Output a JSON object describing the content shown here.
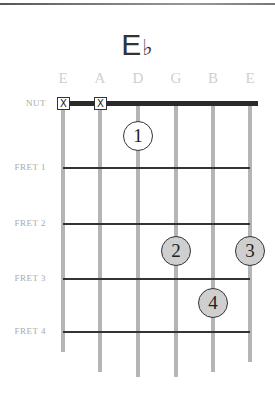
{
  "chord": {
    "root": "E",
    "accidental": "♭",
    "name": "E♭"
  },
  "strings": [
    {
      "label": "E",
      "x": 63,
      "bottom": 352
    },
    {
      "label": "A",
      "x": 100,
      "bottom": 372
    },
    {
      "label": "D",
      "x": 138,
      "bottom": 377
    },
    {
      "label": "G",
      "x": 176,
      "bottom": 377
    },
    {
      "label": "B",
      "x": 213,
      "bottom": 372
    },
    {
      "label": "E",
      "x": 250,
      "bottom": 362
    }
  ],
  "nut_label": "NUT",
  "frets": [
    {
      "label": "FRET 1",
      "y": 168
    },
    {
      "label": "FRET 2",
      "y": 224
    },
    {
      "label": "FRET 3",
      "y": 279
    },
    {
      "label": "FRET 4",
      "y": 332
    }
  ],
  "muted": [
    {
      "string": 0,
      "symbol": "X"
    },
    {
      "string": 1,
      "symbol": "X"
    }
  ],
  "fingers": [
    {
      "number": "1",
      "string": 2,
      "fret": 0,
      "x": 138,
      "y": 136,
      "style": "open-pos"
    },
    {
      "number": "2",
      "string": 3,
      "fret": 2,
      "x": 176,
      "y": 251,
      "style": "fretted"
    },
    {
      "number": "3",
      "string": 5,
      "fret": 2,
      "x": 250,
      "y": 251,
      "style": "fretted"
    },
    {
      "number": "4",
      "string": 4,
      "fret": 3,
      "x": 213,
      "y": 303,
      "style": "fretted"
    }
  ],
  "colors": {
    "nut": "#2a2a2a",
    "string": "#b5b5b5",
    "fret": "#333333",
    "finger_fill": "#cfcfcf"
  }
}
